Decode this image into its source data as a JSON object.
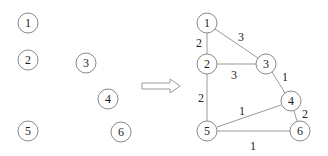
{
  "diagram": {
    "left_graph": {
      "nodes": [
        {
          "id": "1",
          "label": "1",
          "x": 28,
          "y": 23
        },
        {
          "id": "2",
          "label": "2",
          "x": 28,
          "y": 60
        },
        {
          "id": "3",
          "label": "3",
          "x": 86,
          "y": 63
        },
        {
          "id": "4",
          "label": "4",
          "x": 108,
          "y": 99
        },
        {
          "id": "5",
          "label": "5",
          "x": 28,
          "y": 131
        },
        {
          "id": "6",
          "label": "6",
          "x": 121,
          "y": 132
        }
      ],
      "edges": []
    },
    "arrow": {
      "direction": "right",
      "style": "hollow"
    },
    "right_graph": {
      "nodes": [
        {
          "id": "1",
          "label": "1",
          "x": 207,
          "y": 23
        },
        {
          "id": "2",
          "label": "2",
          "x": 207,
          "y": 64
        },
        {
          "id": "3",
          "label": "3",
          "x": 266,
          "y": 64
        },
        {
          "id": "4",
          "label": "4",
          "x": 291,
          "y": 101
        },
        {
          "id": "5",
          "label": "5",
          "x": 207,
          "y": 131
        },
        {
          "id": "6",
          "label": "6",
          "x": 300,
          "y": 131
        }
      ],
      "edges": [
        {
          "from": "1",
          "to": "2",
          "weight": "2"
        },
        {
          "from": "1",
          "to": "3",
          "weight": "3"
        },
        {
          "from": "2",
          "to": "3",
          "weight": "3"
        },
        {
          "from": "2",
          "to": "5",
          "weight": "2"
        },
        {
          "from": "3",
          "to": "4",
          "weight": "1"
        },
        {
          "from": "4",
          "to": "5",
          "weight": "1"
        },
        {
          "from": "4",
          "to": "6",
          "weight": "2"
        },
        {
          "from": "5",
          "to": "6",
          "weight": "1"
        }
      ]
    }
  }
}
